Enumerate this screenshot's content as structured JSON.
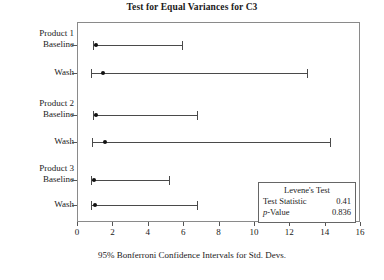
{
  "chart_data": {
    "type": "interval",
    "title": "Test for Equal Variances for C3",
    "xlabel": "95% Bonferroni Confidence Intervals for Std. Devs.",
    "ylabel": "",
    "xlim": [
      0,
      16
    ],
    "xticks": [
      0,
      2,
      4,
      6,
      8,
      10,
      12,
      14,
      16
    ],
    "grid": false,
    "groups": [
      {
        "name": "Product 1",
        "rows": [
          {
            "label": "Baseline",
            "point": 1.05,
            "lower": 0.9,
            "upper": 5.95
          },
          {
            "label": "Wash",
            "point": 1.45,
            "lower": 0.8,
            "upper": 13.0
          }
        ]
      },
      {
        "name": "Product 2",
        "rows": [
          {
            "label": "Baseline",
            "point": 1.05,
            "lower": 0.9,
            "upper": 6.8
          },
          {
            "label": "Wash",
            "point": 1.6,
            "lower": 0.85,
            "upper": 14.3
          }
        ]
      },
      {
        "name": "Product 3",
        "rows": [
          {
            "label": "Baseline",
            "point": 0.95,
            "lower": 0.8,
            "upper": 5.2
          },
          {
            "label": "Wash",
            "point": 1.0,
            "lower": 0.8,
            "upper": 6.8
          }
        ]
      }
    ],
    "annotation": {
      "title": "Levene's Test",
      "rows": [
        {
          "label": "Test Statistic",
          "value": "0.41"
        },
        {
          "label_prefix": "p",
          "label": "-Value",
          "value": "0.836"
        }
      ]
    }
  },
  "legend": {
    "title": "Levene's Test",
    "statistic_label": "Test Statistic",
    "statistic_value": "0.41",
    "pvalue_prefix": "p",
    "pvalue_label": "-Value",
    "pvalue_value": "0.836"
  },
  "colors": {
    "line": "#4a4a4a",
    "frame": "#8a8a8a",
    "text": "#1a1a1a",
    "marker": "#111111"
  }
}
